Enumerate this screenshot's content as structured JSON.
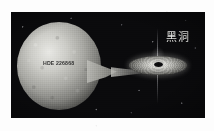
{
  "figure": {
    "caption_none": "",
    "background_color": "#0a0a0c",
    "border_color": "#fdfdfd",
    "labels": {
      "star_name": "HDE 226868",
      "black_hole": "黑洞"
    },
    "objects": {
      "star": "blue-supergiant-star",
      "stream": "accretion-stream",
      "disk": "accretion-disk",
      "hole": "black-hole",
      "jet": "relativistic-jet",
      "stars": "starfield"
    },
    "colors": {
      "space": "#0a0a0c",
      "star_bright": "#e8e8e4",
      "star_mid": "#a9a9a4",
      "star_dark": "#4f4f4c",
      "disk_bright": "#f2f2ee",
      "disk_dark": "#2f2f2d",
      "hole": "#070708",
      "label_light": "#efefec",
      "label_dark": "#1b1b1b"
    }
  }
}
